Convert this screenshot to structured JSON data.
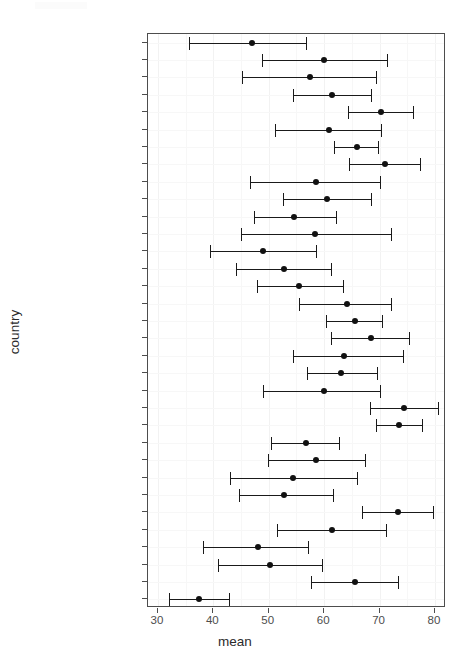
{
  "chart_data": {
    "type": "scatter",
    "subtype": "dot-plot-with-error-bars",
    "title": "",
    "xlabel": "mean",
    "ylabel": "country",
    "xlim": [
      28.2,
      82.0
    ],
    "xticks": [
      30,
      40,
      50,
      60,
      70,
      80
    ],
    "xticklabels": [
      "30",
      "40",
      "50",
      "60",
      "70",
      "80"
    ],
    "grid": true,
    "legend": null,
    "orientation": "horizontal",
    "categories": [
      "Yemen, Rep.",
      "West Bank and Gaza",
      "Vietnam",
      "Thailand",
      "Taiwan",
      "Syria",
      "Sri Lanka",
      "Singapore",
      "Saudi Arabia",
      "Philippines",
      "Pakistan",
      "Oman",
      "Nepal",
      "Myanmar",
      "Mongolia",
      "Malaysia",
      "Lebanon",
      "Kuwait",
      "Korea, Rep.",
      "Korea, Dem. Rep.",
      "Jordan",
      "Japan",
      "Israel",
      "Iraq",
      "Iran",
      "Indonesia",
      "India",
      "Hong Kong, China",
      "China",
      "Cambodia",
      "Bangladesh",
      "Bahrain",
      "Afghanistan"
    ],
    "series": [
      {
        "name": "mean",
        "values": [
          46.9,
          60.0,
          57.4,
          61.5,
          70.3,
          60.8,
          66.0,
          70.9,
          58.5,
          60.6,
          54.6,
          58.3,
          49.0,
          52.8,
          55.5,
          64.1,
          65.6,
          68.4,
          63.6,
          63.0,
          59.9,
          74.5,
          73.5,
          56.7,
          58.5,
          54.3,
          52.8,
          73.3,
          61.4,
          48.0,
          50.2,
          65.6,
          37.4
        ]
      },
      {
        "name": "lower",
        "values": [
          35.6,
          48.8,
          45.1,
          54.3,
          64.3,
          51.1,
          61.8,
          64.4,
          46.6,
          52.5,
          47.4,
          44.9,
          39.4,
          44.1,
          47.8,
          55.4,
          60.3,
          61.3,
          54.3,
          56.9,
          49.0,
          68.3,
          69.4,
          50.4,
          49.8,
          43.0,
          44.6,
          66.9,
          51.5,
          38.2,
          40.9,
          57.6,
          32.0
        ]
      },
      {
        "name": "upper",
        "values": [
          56.7,
          71.4,
          69.4,
          68.4,
          76.1,
          70.3,
          69.8,
          77.3,
          70.0,
          68.4,
          62.1,
          72.0,
          58.5,
          61.3,
          63.4,
          72.0,
          70.5,
          75.3,
          74.3,
          69.6,
          70.1,
          80.5,
          77.6,
          62.6,
          67.4,
          65.9,
          61.6,
          79.6,
          71.2,
          57.1,
          59.7,
          73.4,
          42.8
        ]
      }
    ]
  },
  "axis": {
    "x_title": "mean",
    "y_title": "country"
  },
  "style": {
    "point_color": "#111111",
    "line_color": "#1a1a1a",
    "panel_border": "#4d4d4d",
    "grid_color": "#f2f2f2",
    "tick_label_color": "#4d4d4d",
    "background": "#ffffff"
  }
}
